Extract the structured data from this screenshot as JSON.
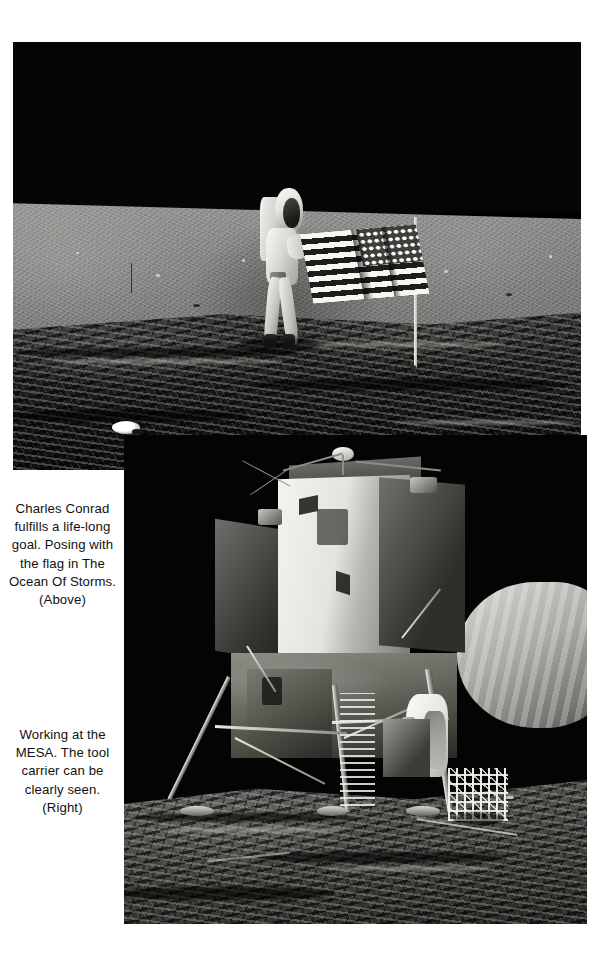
{
  "page": {
    "background_color": "#ffffff",
    "width": 612,
    "height": 957
  },
  "photos": [
    {
      "id": "photo-flag",
      "name": "astronaut-flag-photo",
      "subject": "Charles Conrad standing beside the deployed United States flag on the lunar surface",
      "alt_text": "Astronaut in white spacesuit holding the US flag on the Moon, black sky above a grey lunar plain with dark rocky foreground",
      "sky_color": "#050505",
      "terrain_color": "#8b8b89",
      "foreground_color": "#1a1a18"
    },
    {
      "id": "photo-lm",
      "name": "lunar-module-photo",
      "subject": "Apollo Lunar Module Intrepid on the Moon with an astronaut working at the MESA",
      "alt_text": "Lunar Module standing on four landing legs against a black sky, astronaut in white suit at the MESA with the tool carrier in front",
      "sky_color": "#040404",
      "terrain_color": "#4a4a46"
    }
  ],
  "captions": [
    {
      "id": "caption-above",
      "name": "caption-flag-photo",
      "lines": [
        "Charles Conrad",
        "fulfills a life-long",
        "goal. Posing with",
        "the flag in The",
        "Ocean Of Storms.",
        "(Above)"
      ],
      "text": "Charles Conrad fulfills a life-long goal. Posing with the flag in The Ocean Of Storms. (Above)",
      "reference": "(Above)",
      "align": "center"
    },
    {
      "id": "caption-right",
      "name": "caption-lunar-module-photo",
      "lines": [
        "Working at the",
        "MESA. The tool",
        "carrier can be",
        "clearly seen.",
        "(Right)"
      ],
      "text": "Working at the MESA. The tool carrier can be clearly seen. (Right)",
      "reference": "(Right)",
      "align": "center"
    }
  ]
}
